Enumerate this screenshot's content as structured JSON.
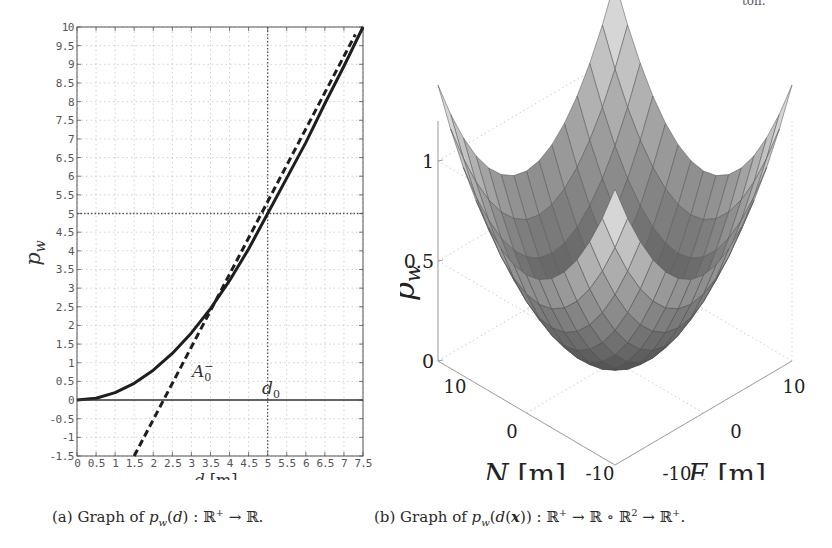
{
  "page": {
    "top_fragment": "ton."
  },
  "captions": {
    "a": {
      "label": "(a)",
      "text": "Graph of p_w(d) : ℝ⁺ → ℝ."
    },
    "b": {
      "label": "(b)",
      "text": "Graph of p_w(d(x)) : ℝ⁺ → ℝ ∘ ℝ² → ℝ⁺."
    }
  },
  "chart_data": [
    {
      "type": "line",
      "title": "",
      "xlabel": "d [m]",
      "ylabel": "p_w",
      "xlim": [
        0,
        7.5
      ],
      "ylim": [
        -1.5,
        10
      ],
      "grid": true,
      "x_ticks": [
        "0",
        "0.5",
        "1",
        "1.5",
        "2",
        "2.5",
        "3",
        "3.5",
        "4",
        "4.5",
        "5",
        "5.5",
        "6",
        "6.5",
        "7",
        "7.5"
      ],
      "y_ticks": [
        "-1.5",
        "-1",
        "-0.5",
        "0",
        "0.5",
        "1",
        "1.5",
        "2",
        "2.5",
        "3",
        "3.5",
        "4",
        "4.5",
        "5",
        "5.5",
        "6",
        "6.5",
        "7",
        "7.5",
        "8",
        "8.5",
        "9",
        "9.5",
        "10"
      ],
      "series": [
        {
          "name": "p_w(d)",
          "style": "solid-thick",
          "x": [
            0,
            0.5,
            1,
            1.5,
            2,
            2.5,
            3,
            3.5,
            4,
            4.5,
            5,
            5.5,
            6,
            6.5,
            7,
            7.5
          ],
          "y": [
            0,
            0.05,
            0.2,
            0.45,
            0.8,
            1.25,
            1.8,
            2.45,
            3.2,
            4.05,
            5.0,
            5.95,
            6.9,
            7.95,
            8.95,
            10.0
          ]
        },
        {
          "name": "A_0^- (tangent)",
          "style": "dashed-thick",
          "x": [
            1.5,
            7.3
          ],
          "y": [
            -1.5,
            9.8
          ]
        },
        {
          "name": "p_w = 0",
          "style": "solid-thin",
          "x": [
            0,
            7.5
          ],
          "y": [
            0,
            0
          ]
        }
      ],
      "reference_lines": [
        {
          "orientation": "vertical",
          "value": 5,
          "style": "dotted"
        },
        {
          "orientation": "horizontal",
          "value": 5,
          "style": "dotted"
        }
      ],
      "annotations": [
        {
          "text": "A_0^-",
          "x": 2.7,
          "y": 0.6
        },
        {
          "text": "d_0",
          "x": 5.0,
          "y": 0.15
        }
      ]
    },
    {
      "type": "surface",
      "title": "",
      "xlabel": "E [m]",
      "ylabel": "N [m]",
      "zlabel": "p_w",
      "x_ticks": [
        "-10",
        "0",
        "10"
      ],
      "y_ticks": [
        "-10",
        "0",
        "10"
      ],
      "z_ticks": [
        "0",
        "0.5",
        "1"
      ],
      "xlim": [
        -10,
        10
      ],
      "ylim": [
        -10,
        10
      ],
      "zlim": [
        0,
        1.4
      ],
      "shape": "convex bowl, minimum 0 at origin, rising toward corners",
      "colormap": "grayscale"
    }
  ],
  "plot_a": {
    "xlabel_var": "d",
    "xlabel_unit": "[m]",
    "ylabel_var": "p",
    "ylabel_sub": "w",
    "ann_A": "A",
    "ann_A_sub": "0",
    "ann_A_sup": "−",
    "ann_d": "d",
    "ann_d_sub": "0"
  },
  "plot_b": {
    "zlabel_var": "p",
    "zlabel_sub": "w",
    "z_ticks": [
      "1",
      "0.5",
      "0"
    ],
    "n_label": "N [m]",
    "e_label": "E [m]",
    "n_ticks": [
      "10",
      "0",
      "-10"
    ],
    "e_ticks": [
      "-10",
      "0",
      "10"
    ]
  }
}
